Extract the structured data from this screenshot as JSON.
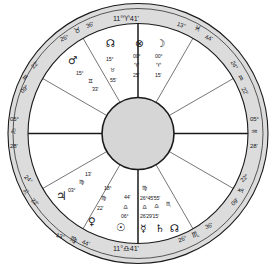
{
  "chart": {
    "type": "astrological-natal-wheel",
    "ring_fill": "#dcdcdc",
    "hub_fill": "#d6d6d6",
    "stroke": "#1a1a1a",
    "background": "#ffffff"
  },
  "glyphs": {
    "aries": "♈",
    "taurus": "♉",
    "gemini": "♊",
    "cancer": "♋",
    "leo": "♌",
    "virgo": "♍",
    "libra": "♎",
    "scorpio": "♏",
    "sagittarius": "♐",
    "capricorn": "♑",
    "aquarius": "♒",
    "pisces": "♓",
    "sun": "☉",
    "moon": "☽",
    "mercury": "☿",
    "venus": "♀",
    "mars": "♂",
    "jupiter": "♃",
    "saturn": "♄",
    "north_node": "☊",
    "south_node": "☋",
    "part_of_fortune": "⊗"
  },
  "cusps": [
    {
      "id": "mc",
      "name": "midheaven-cusp",
      "degree": "11°",
      "sign": "♈",
      "minute": "41'"
    },
    {
      "id": "cusp-11",
      "name": "cusp-eleven",
      "degree": "13°",
      "sign": "♓",
      "minute": "44'"
    },
    {
      "id": "cusp-12",
      "name": "cusp-twelve",
      "degree": "24°",
      "sign": "♒",
      "minute": "22'"
    },
    {
      "id": "dsc",
      "name": "descendant-cusp",
      "degree": "05°",
      "sign": "♒",
      "minute": "28'"
    },
    {
      "id": "cusp-2",
      "name": "cusp-two",
      "degree": "22°",
      "sign": "♑",
      "minute": "09'"
    },
    {
      "id": "cusp-3",
      "name": "cusp-three",
      "degree": "26°",
      "sign": "♏",
      "minute": "36'"
    },
    {
      "id": "ic",
      "name": "imum-coeli-cusp",
      "degree": "11°",
      "sign": "♎",
      "minute": "41'"
    },
    {
      "id": "cusp-5",
      "name": "cusp-five",
      "degree": "13°",
      "sign": "♍",
      "minute": "44'"
    },
    {
      "id": "cusp-6",
      "name": "cusp-six",
      "degree": "24°",
      "sign": "♌",
      "minute": "22'"
    },
    {
      "id": "asc",
      "name": "ascendant-cusp",
      "degree": "05°",
      "sign": "♌",
      "minute": "28'"
    },
    {
      "id": "cusp-8",
      "name": "cusp-eight",
      "degree": "09°",
      "sign": "♒",
      "minute": "22'"
    },
    {
      "id": "cusp-9",
      "name": "cusp-nine",
      "degree": "26°",
      "sign": "♉",
      "minute": "36'"
    }
  ],
  "planets": [
    {
      "id": "fortune",
      "name": "part-of-fortune",
      "glyph": "⊗",
      "degree": "00°",
      "sign": "♈",
      "minute": "25'"
    },
    {
      "id": "moon",
      "name": "moon",
      "glyph": "☽",
      "degree": "00°",
      "sign": "♈",
      "minute": "15'"
    },
    {
      "id": "node-n",
      "name": "north-node",
      "glyph": "☊",
      "degree": "15°",
      "sign": "♉",
      "minute": "55'"
    },
    {
      "id": "mars",
      "name": "mars",
      "glyph": "♂",
      "degree": "15°",
      "sign": "♊",
      "minute": "33'"
    },
    {
      "id": "jupiter",
      "name": "jupiter",
      "glyph": "♃",
      "degree": "03°",
      "sign": "♍",
      "minute": "13'"
    },
    {
      "id": "venus",
      "name": "venus",
      "glyph": "♀",
      "degree": "18°",
      "sign": "♍",
      "minute": "22'"
    },
    {
      "id": "sun",
      "name": "sun",
      "glyph": "☉",
      "degree": "06°",
      "sign": "♎",
      "minute": "44'"
    },
    {
      "id": "mercury",
      "name": "mercury",
      "glyph": "☿",
      "degree": "26°",
      "sign": "♍",
      "minute": "24'"
    },
    {
      "id": "saturn",
      "name": "saturn",
      "glyph": "♄",
      "degree": "29°",
      "sign": "♎",
      "minute": "45'"
    },
    {
      "id": "node-s",
      "name": "south-node",
      "glyph": "☊",
      "degree": "15°",
      "sign": "♏",
      "minute": "55'"
    }
  ],
  "top_cluster": {
    "fortune_glyph": "⊗",
    "moon_glyph": "☽",
    "fortune_deg": "00°",
    "moon_deg": "00°",
    "fortune_sign": "♈",
    "moon_sign": "♈",
    "fortune_min": "25'",
    "moon_min": "15'"
  },
  "bottom_cluster": {
    "sign_top": "♍",
    "degrees_row": "26°45'55'",
    "signs_row_a": "♎",
    "signs_row_b": "♎",
    "signs_row_c": "♏",
    "minutes_row": "26'29'15'",
    "glyph_mercury": "☿",
    "glyph_saturn": "♄",
    "glyph_node": "☊"
  },
  "upper_left_cluster": {
    "mars_glyph": "♂",
    "mars_deg": "15°",
    "mars_sign": "♊",
    "mars_min": "33'",
    "node_glyph": "☊",
    "node_deg": "15°",
    "node_sign": "♉",
    "node_min": "55'"
  },
  "lower_left_cluster": {
    "jupiter_glyph": "♃",
    "jupiter_deg": "03°",
    "jupiter_sign": "♍",
    "jupiter_min": "13'",
    "venus_glyph": "♀",
    "venus_deg": "18°",
    "venus_sign": "♍",
    "venus_min": "22'",
    "sun_glyph": "☉",
    "sun_deg": "06°",
    "sun_sign": "♎",
    "sun_min": "44'"
  }
}
